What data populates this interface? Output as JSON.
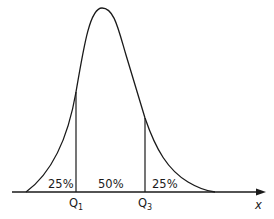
{
  "diagram": {
    "type": "skewed-distribution-quartiles",
    "axis": {
      "label": "x"
    },
    "quartiles": [
      {
        "name": "Q1",
        "base": "Q",
        "sub": "1"
      },
      {
        "name": "Q3",
        "base": "Q",
        "sub": "3"
      }
    ],
    "regions": [
      {
        "label": "25%"
      },
      {
        "label": "50%"
      },
      {
        "label": "25%"
      }
    ],
    "colors": {
      "stroke": "#1a1a1a",
      "background": "#ffffff"
    }
  }
}
